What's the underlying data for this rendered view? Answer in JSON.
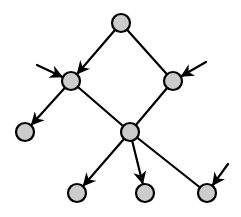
{
  "diagram": {
    "type": "directed-graph",
    "width": 241,
    "height": 217,
    "node_radius": 9,
    "colors": {
      "node_fill": "#cccccc",
      "stroke": "#000000",
      "background": "#ffffff"
    },
    "nodes": [
      {
        "id": "top",
        "x": 121,
        "y": 23
      },
      {
        "id": "left",
        "x": 71,
        "y": 81
      },
      {
        "id": "right",
        "x": 173,
        "y": 81
      },
      {
        "id": "bottom-left",
        "x": 25,
        "y": 132
      },
      {
        "id": "center",
        "x": 130,
        "y": 132
      },
      {
        "id": "bottom-1",
        "x": 77,
        "y": 193
      },
      {
        "id": "bottom-2",
        "x": 145,
        "y": 193
      },
      {
        "id": "bottom-3",
        "x": 207,
        "y": 193
      }
    ],
    "edges": [
      {
        "from": "top",
        "to": "left",
        "arrow": true
      },
      {
        "from": "top",
        "to": "right",
        "arrow": false
      },
      {
        "from": "left",
        "to": "bottom-left",
        "arrow": true
      },
      {
        "from": "left",
        "to": "center",
        "arrow": false
      },
      {
        "from": "right",
        "to": "center",
        "arrow": false
      },
      {
        "from": "center",
        "to": "bottom-1",
        "arrow": true
      },
      {
        "from": "center",
        "to": "bottom-2",
        "arrow": true
      },
      {
        "from": "center",
        "to": "bottom-3",
        "arrow": false
      }
    ],
    "external_inputs": [
      {
        "from_x": 37,
        "from_y": 65,
        "to": "left"
      },
      {
        "from_x": 206,
        "from_y": 62,
        "to": "right"
      },
      {
        "from_x": 228,
        "from_y": 164,
        "to": "bottom-3"
      }
    ]
  }
}
